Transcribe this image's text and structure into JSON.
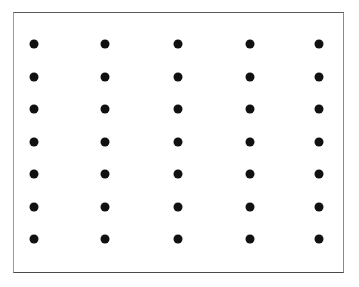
{
  "canvas": {
    "width": 359,
    "height": 287,
    "background_color": "#ffffff"
  },
  "frame": {
    "label": "dot grid frame",
    "left": 13,
    "top": 12,
    "width": 331,
    "height": 261,
    "border_width": 1,
    "border_color": "#707070",
    "fill_color": "#ffffff"
  },
  "chart_data": {
    "type": "scatter",
    "title": "",
    "subtitle": "",
    "xlabel": "",
    "ylabel": "",
    "grid": false,
    "legend": null,
    "legend_position": "none",
    "annotations": [],
    "marker": {
      "shape": "circle",
      "color": "#111111",
      "diameter_px": 9
    },
    "rows": 7,
    "columns": 5,
    "total_points": 35,
    "column_centers_px": [
      33,
      104,
      177,
      249,
      318
    ],
    "row_centers_px": [
      43,
      76,
      108,
      141,
      173,
      206,
      238
    ],
    "xlim": [
      13,
      344
    ],
    "ylim": [
      12,
      273
    ],
    "points": [
      {
        "x": 33,
        "y": 43
      },
      {
        "x": 104,
        "y": 43
      },
      {
        "x": 177,
        "y": 43
      },
      {
        "x": 249,
        "y": 43
      },
      {
        "x": 318,
        "y": 43
      },
      {
        "x": 33,
        "y": 76
      },
      {
        "x": 104,
        "y": 76
      },
      {
        "x": 177,
        "y": 76
      },
      {
        "x": 249,
        "y": 76
      },
      {
        "x": 318,
        "y": 76
      },
      {
        "x": 33,
        "y": 108
      },
      {
        "x": 104,
        "y": 108
      },
      {
        "x": 177,
        "y": 108
      },
      {
        "x": 249,
        "y": 108
      },
      {
        "x": 318,
        "y": 108
      },
      {
        "x": 33,
        "y": 141
      },
      {
        "x": 104,
        "y": 141
      },
      {
        "x": 177,
        "y": 141
      },
      {
        "x": 249,
        "y": 141
      },
      {
        "x": 318,
        "y": 141
      },
      {
        "x": 33,
        "y": 173
      },
      {
        "x": 104,
        "y": 173
      },
      {
        "x": 177,
        "y": 173
      },
      {
        "x": 249,
        "y": 173
      },
      {
        "x": 318,
        "y": 173
      },
      {
        "x": 33,
        "y": 206
      },
      {
        "x": 104,
        "y": 206
      },
      {
        "x": 177,
        "y": 206
      },
      {
        "x": 249,
        "y": 206
      },
      {
        "x": 318,
        "y": 206
      },
      {
        "x": 33,
        "y": 238
      },
      {
        "x": 104,
        "y": 238
      },
      {
        "x": 177,
        "y": 238
      },
      {
        "x": 249,
        "y": 238
      },
      {
        "x": 318,
        "y": 238
      }
    ]
  }
}
